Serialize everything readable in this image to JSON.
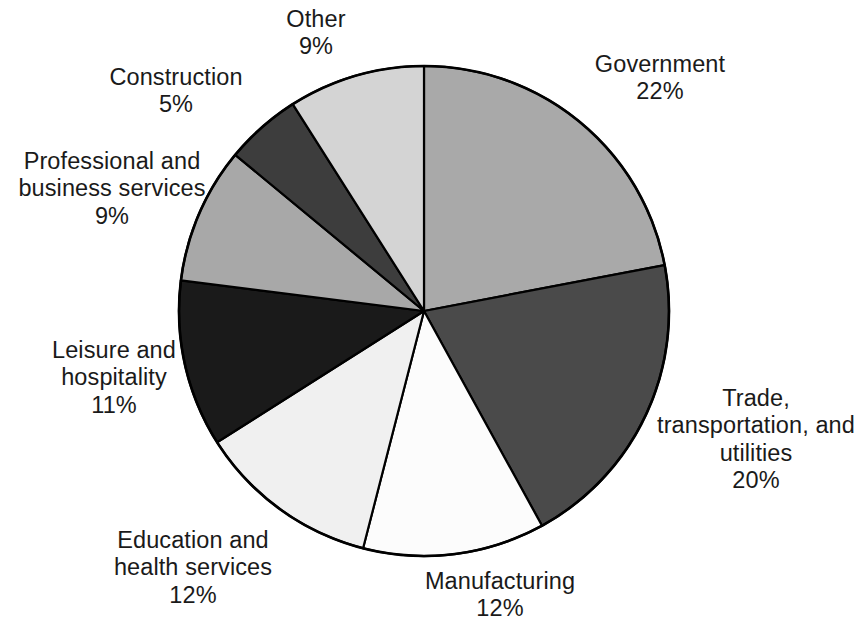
{
  "chart_data": {
    "type": "pie",
    "title": "",
    "subtitle": "",
    "xlabel": "",
    "ylabel": "",
    "legend_position": "none",
    "labels_position": "outside",
    "start_angle_deg": 0,
    "direction": "clockwise",
    "units": "percent",
    "categories": [
      "Government",
      "Trade, transportation, and utilities",
      "Manufacturing",
      "Education and health services",
      "Leisure and hospitality",
      "Professional and business services",
      "Construction",
      "Other"
    ],
    "values": [
      22,
      20,
      12,
      12,
      11,
      9,
      9,
      5
    ],
    "colors": [
      "#a9a9a9",
      "#4a4a4a",
      "#fcfcfc",
      "#f0f0f0",
      "#1a1a1a",
      "#a8a8a8",
      "#3d3d3d",
      "#d4d4d4"
    ],
    "slices": [
      {
        "label": "Government",
        "value": 22,
        "value_text": "22%",
        "color": "#a9a9a9",
        "label_lines": [
          "Government"
        ]
      },
      {
        "label": "Trade, transportation, and utilities",
        "value": 20,
        "value_text": "20%",
        "color": "#4a4a4a",
        "label_lines": [
          "Trade,",
          "transportation, and",
          "utilities"
        ]
      },
      {
        "label": "Manufacturing",
        "value": 12,
        "value_text": "12%",
        "color": "#fcfcfc",
        "label_lines": [
          "Manufacturing"
        ]
      },
      {
        "label": "Education and health services",
        "value": 12,
        "value_text": "12%",
        "color": "#f0f0f0",
        "label_lines": [
          "Education and",
          "health services"
        ]
      },
      {
        "label": "Leisure and hospitality",
        "value": 11,
        "value_text": "11%",
        "color": "#1a1a1a",
        "label_lines": [
          "Leisure and",
          "hospitality"
        ]
      },
      {
        "label": "Professional and business services",
        "value": 9,
        "value_text": "9%",
        "color": "#a8a8a8",
        "label_lines": [
          "Professional and",
          "business services"
        ]
      },
      {
        "label": "Construction",
        "value": 5,
        "value_text": "5%",
        "color": "#3d3d3d",
        "label_lines": [
          "Construction"
        ]
      },
      {
        "label": "Other",
        "value": 9,
        "value_text": "9%",
        "color": "#d4d4d4",
        "label_lines": [
          "Other"
        ]
      }
    ]
  },
  "labels": {
    "government": {
      "name": "Government",
      "value": "22%"
    },
    "trade": {
      "name_line1": "Trade,",
      "name_line2": "transportation, and",
      "name_line3": "utilities",
      "value": "20%"
    },
    "manufacturing": {
      "name": "Manufacturing",
      "value": "12%"
    },
    "education": {
      "name_line1": "Education and",
      "name_line2": "health services",
      "value": "12%"
    },
    "leisure": {
      "name_line1": "Leisure and",
      "name_line2": "hospitality",
      "value": "11%"
    },
    "professional": {
      "name_line1": "Professional and",
      "name_line2": "business services",
      "value": "9%"
    },
    "construction": {
      "name": "Construction",
      "value": "5%"
    },
    "other": {
      "name": "Other",
      "value": "9%"
    }
  },
  "style": {
    "outline_color": "#000000",
    "background": "#ffffff",
    "text_color": "#1a1a1a"
  }
}
